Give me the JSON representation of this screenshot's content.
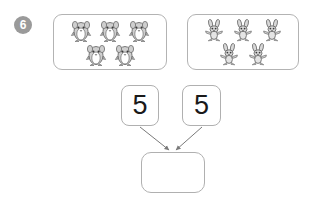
{
  "worksheet": {
    "question_number": "6",
    "background_color": "#ffffff",
    "line_color": "#b0b0b0",
    "badge_color": "#9a9a9a"
  },
  "groups": [
    {
      "name": "penguins",
      "icon": "penguin-icon",
      "count": 5,
      "rows": [
        3,
        2
      ]
    },
    {
      "name": "rabbits",
      "icon": "rabbit-icon",
      "count": 5,
      "rows": [
        3,
        2
      ]
    }
  ],
  "addends": [
    {
      "label": "5"
    },
    {
      "label": "5"
    }
  ],
  "answer": {
    "label": "",
    "placeholder": ""
  },
  "arrows": [
    {
      "name": "arrow-left-to-answer",
      "from": "addend-box-left",
      "to": "answer-box"
    },
    {
      "name": "arrow-right-to-answer",
      "from": "addend-box-right",
      "to": "answer-box"
    }
  ]
}
